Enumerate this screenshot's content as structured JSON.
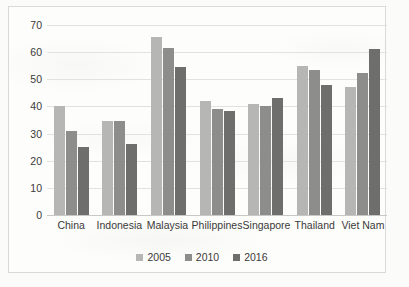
{
  "chart_data": {
    "type": "bar",
    "title": "",
    "subtitle": "",
    "xlabel": "",
    "ylabel": "",
    "ylim": [
      0,
      70
    ],
    "ytick_step": 10,
    "yticks": [
      70,
      60,
      50,
      40,
      30,
      20,
      10,
      0
    ],
    "grid": true,
    "legend_position": "bottom",
    "categories": [
      "China",
      "Indonesia",
      "Malaysia",
      "Philippines",
      "Singapore",
      "Thailand",
      "Viet Nam"
    ],
    "series": [
      {
        "name": "2005",
        "color": "#b6b6b4",
        "values": [
          40,
          34.5,
          65.5,
          42,
          41,
          55,
          47
        ]
      },
      {
        "name": "2010",
        "color": "#8d8d8b",
        "values": [
          31,
          34.5,
          61.5,
          39,
          40,
          53.5,
          52.5
        ]
      },
      {
        "name": "2016",
        "color": "#6e6e6c",
        "values": [
          25,
          26,
          54.5,
          38.5,
          43,
          48,
          61
        ]
      }
    ]
  },
  "colors": {
    "series_2005": "#b6b6b4",
    "series_2010": "#8d8d8b",
    "series_2016": "#6e6e6c",
    "gridline": "#e2e2e0",
    "axis": "#c8c8c6",
    "text": "#3a3a38",
    "frame": "#d9d9d9",
    "background": "#fdfdfc"
  }
}
